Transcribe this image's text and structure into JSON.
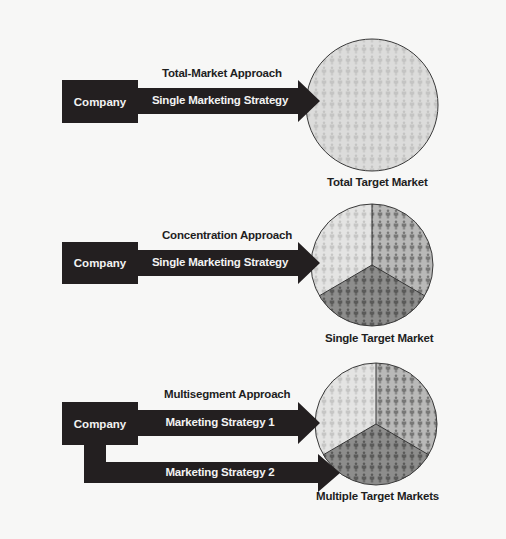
{
  "sections": [
    {
      "approach_title": "Total-Market Approach",
      "company_label": "Company",
      "strategy_labels": [
        "Single Marketing Strategy"
      ],
      "market_label": "Total Target Market"
    },
    {
      "approach_title": "Concentration Approach",
      "company_label": "Company",
      "strategy_labels": [
        "Single Marketing Strategy"
      ],
      "market_label": "Single Target Market"
    },
    {
      "approach_title": "Multisegment Approach",
      "company_label": "Company",
      "strategy_labels": [
        "Marketing Strategy 1",
        "Marketing Strategy 2"
      ],
      "market_label": "Multiple Target Markets"
    }
  ],
  "colors": {
    "dark": "#231f20",
    "segment_light": "#e4e4e3",
    "segment_mid": "#b9b9b8",
    "segment_dark": "#8d8d8c",
    "total_market": "#dcdcdb",
    "people_light": "#c9c9c8",
    "people_mid": "#7d7d7c",
    "people_dark": "#5e5e5d"
  }
}
